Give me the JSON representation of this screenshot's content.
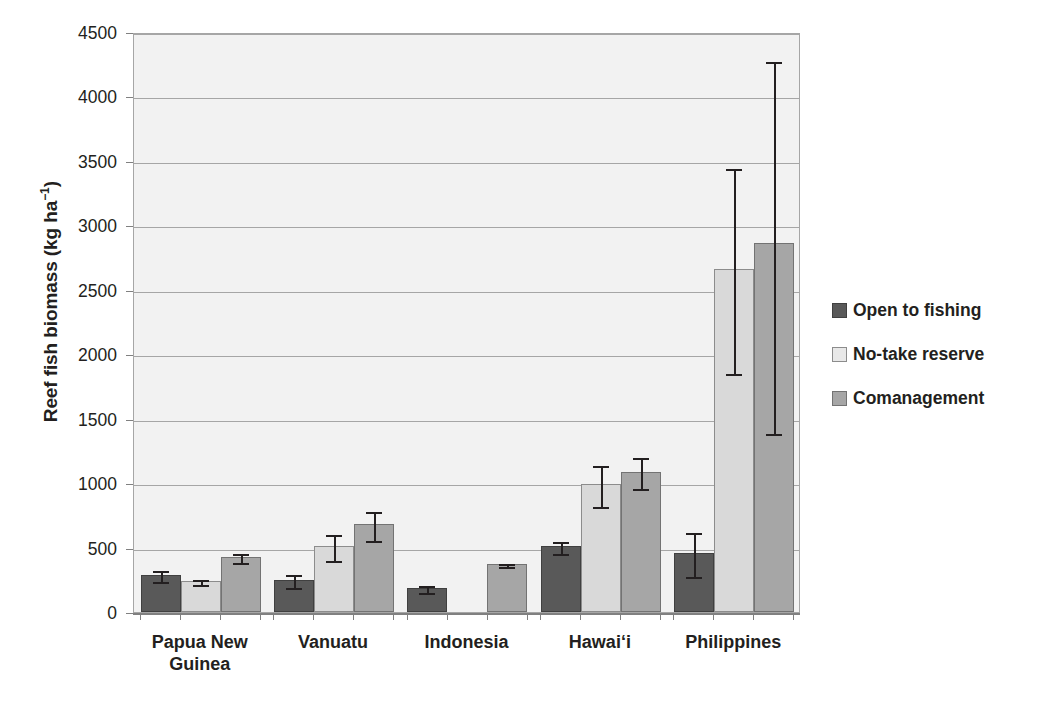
{
  "chart_data": {
    "type": "bar",
    "title": "",
    "xlabel": "",
    "ylabel": "Reef fish biomass (kg ha",
    "ylabel_exponent": "−1",
    "ylabel_suffix": ")",
    "ylim": [
      0,
      4500
    ],
    "ytick_step": 500,
    "grid": true,
    "legend_position": "right",
    "ytick_labels": [
      "0",
      "500",
      "1000",
      "1500",
      "2000",
      "2500",
      "3000",
      "3500",
      "4000",
      "4500"
    ],
    "categories": [
      "Papua New Guinea",
      "Vanuatu",
      "Indonesia",
      "Hawaiʻi",
      "Philippines"
    ],
    "category_lines": [
      [
        "Papua New",
        "Guinea"
      ],
      [
        "Vanuatu"
      ],
      [
        "Indonesia"
      ],
      [
        "Hawaiʻi"
      ],
      [
        "Philippines"
      ]
    ],
    "series": [
      {
        "name": "Open to fishing",
        "color": "#595959",
        "values": [
          290,
          250,
          185,
          510,
          460
        ],
        "err_low": [
          250,
          205,
          160,
          465,
          290
        ],
        "err_high": [
          335,
          300,
          215,
          560,
          625
        ]
      },
      {
        "name": "No-take reserve",
        "color": "#d9d9d9",
        "values": [
          240,
          510,
          null,
          990,
          2660
        ],
        "err_low": [
          225,
          410,
          null,
          830,
          1860
        ],
        "err_high": [
          262,
          612,
          null,
          1150,
          3450
        ]
      },
      {
        "name": "Comanagement",
        "color": "#a6a6a6",
        "values": [
          430,
          680,
          375,
          1090,
          2860
        ],
        "err_low": [
          393,
          568,
          362,
          968,
          1400
        ],
        "err_high": [
          468,
          790,
          390,
          1212,
          4280
        ]
      }
    ]
  },
  "legend": {
    "items": [
      {
        "label": "Open to fishing",
        "swatch": "open"
      },
      {
        "label": "No-take reserve",
        "swatch": "notake"
      },
      {
        "label": "Comanagement",
        "swatch": "comgmt"
      }
    ]
  }
}
